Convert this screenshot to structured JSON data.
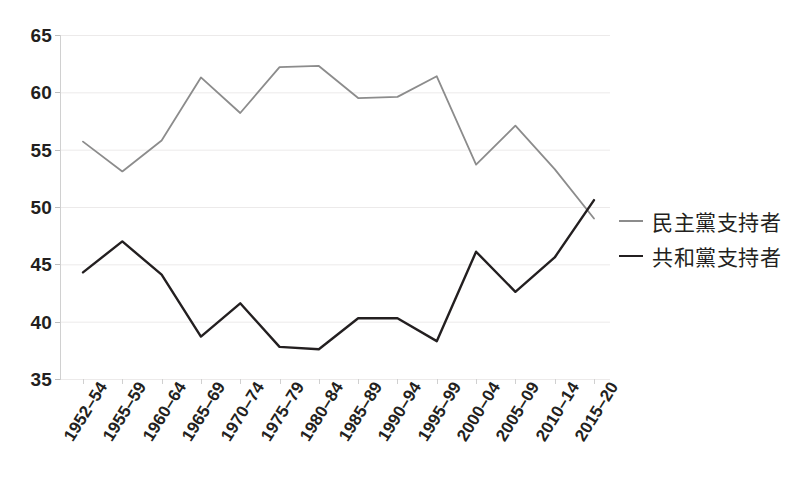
{
  "chart_data": {
    "type": "line",
    "title": "",
    "xlabel": "",
    "ylabel": "",
    "ylim": [
      35,
      65
    ],
    "ytick_step": 5,
    "yticks": [
      65,
      60,
      55,
      50,
      45,
      40,
      35
    ],
    "grid": true,
    "legend_position": "right",
    "categories": [
      "1952–54",
      "1955–59",
      "1960–64",
      "1965–69",
      "1970–74",
      "1975–79",
      "1980–84",
      "1985–89",
      "1990–94",
      "1995–99",
      "2000–04",
      "2005–09",
      "2010–14",
      "2015–20"
    ],
    "series": [
      {
        "name": "民主黨支持者",
        "color": "#8c8c8c",
        "values": [
          55.7,
          53.1,
          55.8,
          61.3,
          58.2,
          62.2,
          62.3,
          59.5,
          59.6,
          61.4,
          53.7,
          57.1,
          53.3,
          49.0
        ]
      },
      {
        "name": "共和黨支持者",
        "color": "#231f20",
        "values": [
          44.3,
          47.0,
          44.1,
          38.7,
          41.6,
          37.8,
          37.6,
          40.3,
          40.3,
          38.3,
          46.1,
          42.6,
          45.6,
          50.6
        ]
      }
    ]
  },
  "legend": {
    "items": [
      {
        "label": "民主黨支持者",
        "color": "#8c8c8c"
      },
      {
        "label": "共和黨支持者",
        "color": "#231f20"
      }
    ]
  },
  "colors": {
    "democrat_line": "#8c8c8c",
    "republican_line": "#231f20",
    "gridline": "#eceaea",
    "axis": "#d0d0d0",
    "text": "#231f20",
    "background": "#ffffff"
  }
}
